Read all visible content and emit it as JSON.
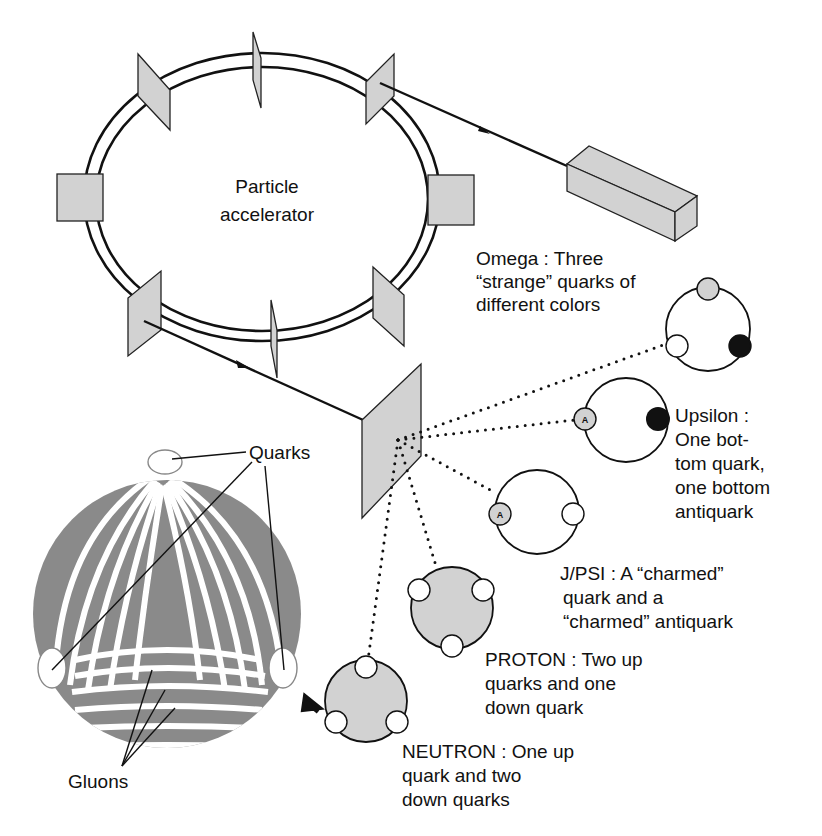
{
  "accelerator": {
    "label_line1": "Particle",
    "label_line2": "accelerator"
  },
  "particles": [
    {
      "name": "Omega",
      "lines": [
        "Omega : Three",
        "“strange” quarks of",
        "different colors"
      ],
      "quarks": [
        "gray",
        "white",
        "black"
      ]
    },
    {
      "name": "Upsilon",
      "lines": [
        "Upsilon :",
        "One bot-",
        "tom quark,",
        "one bottom",
        "antiquark"
      ],
      "quarks": [
        "antiquark-A",
        "black"
      ]
    },
    {
      "name": "J/PSI",
      "lines": [
        "J/PSI : A “charmed”",
        "quark  and  a",
        "“charmed” antiquark"
      ],
      "quarks": [
        "antiquark-A",
        "white"
      ]
    },
    {
      "name": "Proton",
      "lines": [
        "PROTON : Two up",
        "quarks and one",
        "down quark"
      ],
      "quarks": [
        "white",
        "white",
        "white"
      ]
    },
    {
      "name": "Neutron",
      "lines": [
        "NEUTRON : One up",
        "quark and two",
        "down quarks"
      ],
      "quarks": [
        "white",
        "white",
        "white"
      ]
    }
  ],
  "nucleon_detail": {
    "quarks_label": "Quarks",
    "gluons_label": "Gluons"
  },
  "antiquark_mark": "A",
  "colors": {
    "panel_gray": "#d2d2d2",
    "gluon_gray": "#8a8a8a",
    "ink": "#111111"
  }
}
